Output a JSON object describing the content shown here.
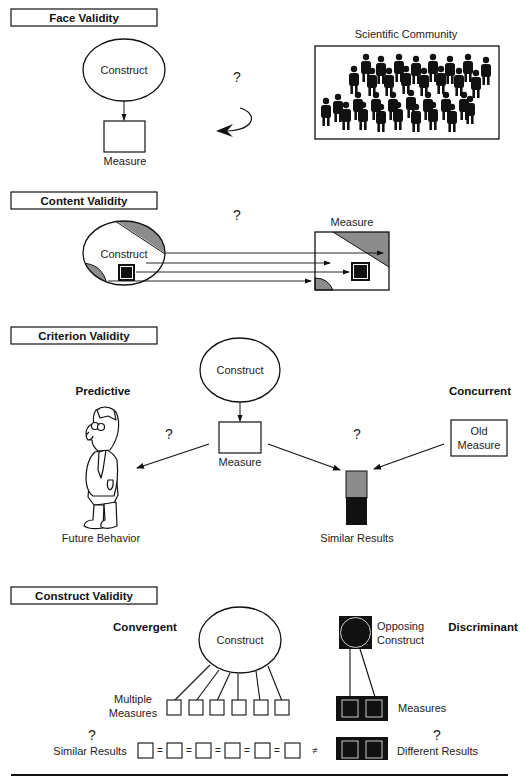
{
  "sections": {
    "face": {
      "title": "Face Validity",
      "construct": "Construct",
      "measure": "Measure",
      "question": "?",
      "community": "Scientific Community"
    },
    "content": {
      "title": "Content Validity",
      "construct": "Construct",
      "measure": "Measure",
      "question": "?"
    },
    "criterion": {
      "title": "Criterion Validity",
      "construct": "Construct",
      "measure": "Measure",
      "predictive": "Predictive",
      "concurrent": "Concurrent",
      "old_measure_line1": "Old",
      "old_measure_line2": "Measure",
      "future_behavior": "Future Behavior",
      "similar_results": "Similar Results",
      "question_left": "?",
      "question_right": "?"
    },
    "construct": {
      "title": "Construct Validity",
      "convergent": "Convergent",
      "discriminant": "Discriminant",
      "construct": "Construct",
      "opposing_line1": "Opposing",
      "opposing_line2": "Construct",
      "multiple_line1": "Multiple",
      "multiple_line2": "Measures",
      "measures": "Measures",
      "similar_results": "Similar Results",
      "different_results": "Different Results",
      "question_left": "?",
      "question_right": "?",
      "equals": "=",
      "not_equal": "≠"
    }
  },
  "colors": {
    "ink": "#111111",
    "gray_fill": "#8c8c8c",
    "paper": "#ffffff"
  }
}
